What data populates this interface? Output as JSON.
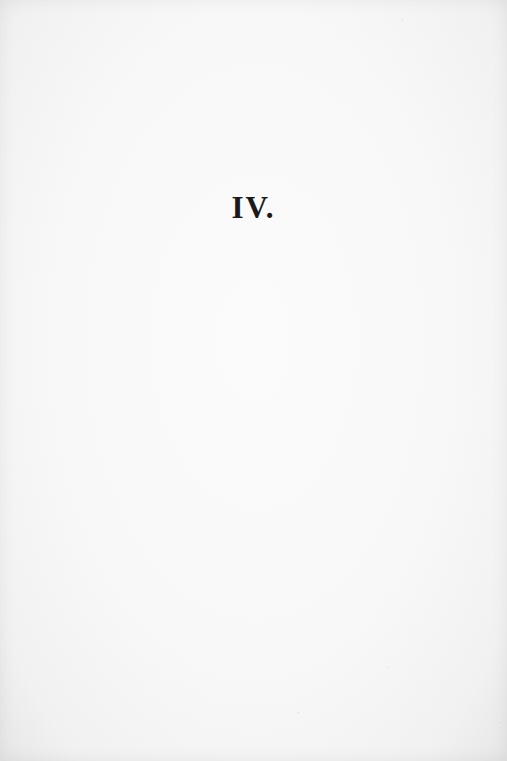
{
  "page": {
    "heading": "IV.",
    "background_color": "#f8f8f8",
    "text_color": "#1a1a1a"
  }
}
